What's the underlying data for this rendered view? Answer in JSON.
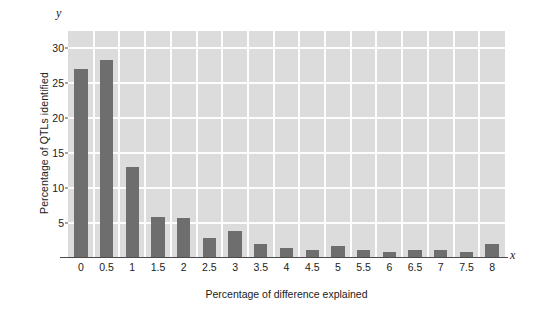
{
  "chart_data": {
    "type": "bar",
    "title": "",
    "xlabel": "Percentage of difference explained",
    "ylabel": "Percentage of QTLs identified",
    "x_axis_letter": "x",
    "y_axis_letter": "y",
    "categories": [
      "0",
      "0.5",
      "1",
      "1.5",
      "2",
      "2.5",
      "3",
      "3.5",
      "4",
      "4.5",
      "5",
      "5.5",
      "6",
      "6.5",
      "7",
      "7.5",
      "8"
    ],
    "values": [
      27.0,
      28.3,
      13.0,
      5.9,
      5.8,
      2.8,
      3.9,
      2.0,
      1.5,
      1.2,
      1.7,
      1.2,
      0.9,
      1.1,
      1.2,
      0.9,
      2.0
    ],
    "ylim": [
      0,
      32.5
    ],
    "yticks": [
      5,
      10,
      15,
      20,
      25,
      30
    ],
    "ytick_labels": [
      "5",
      "10",
      "15",
      "20",
      "25",
      "30"
    ],
    "grid": true,
    "legend": null,
    "colors": {
      "bar": "#6e6e6e",
      "plot_background": "#dcdcdc",
      "gridline": "#fdfdfd",
      "axis": "#4a4a4a",
      "text": "#1b1b1b",
      "figure_background": "#ffffff"
    }
  }
}
